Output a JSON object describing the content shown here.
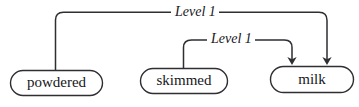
{
  "diagram": {
    "type": "dependency-graph",
    "orientation": "horizontal",
    "background_color": "#ffffff",
    "line_color": "#2e2e33",
    "text_color": "#16161a",
    "nodes": [
      {
        "id": "powdered",
        "label": "powdered",
        "shape": "stadium",
        "x": 10,
        "y": 70,
        "width": 93,
        "height": 26
      },
      {
        "id": "skimmed",
        "label": "skimmed",
        "shape": "stadium",
        "x": 140,
        "y": 68,
        "width": 88,
        "height": 26
      },
      {
        "id": "milk",
        "label": "milk",
        "shape": "stadium",
        "x": 270,
        "y": 66,
        "width": 84,
        "height": 27
      }
    ],
    "edges": [
      {
        "id": "edge-powdered-milk",
        "from": "powdered",
        "to": "milk",
        "label": "Level 1",
        "arrowhead": "to-target",
        "routing": "orthogonal-rounded",
        "label_position": "top-center"
      },
      {
        "id": "edge-skimmed-milk",
        "from": "skimmed",
        "to": "milk",
        "label": "Level 1",
        "arrowhead": "to-target",
        "routing": "orthogonal-rounded",
        "label_position": "mid-center"
      }
    ]
  }
}
